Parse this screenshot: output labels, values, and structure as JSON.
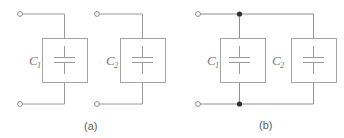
{
  "figure": {
    "type": "circuit-diagram",
    "line_color": "#9a9a9a",
    "box_color": "#a0a0a0",
    "node_color": "#3a3a3a",
    "terminal_color": "#8a8a8a",
    "background": "#ffffff"
  },
  "panels": [
    {
      "id": "panel-a",
      "label": "(a)",
      "label_x": 91,
      "label_y": 130,
      "components": [
        {
          "id": "cap-a1",
          "label": "C",
          "subscript": "1",
          "label_x": 29,
          "label_y": 65,
          "sub_x": 37,
          "sub_y": 68,
          "box": {
            "x": 42,
            "y": 38,
            "w": 45,
            "h": 44
          }
        },
        {
          "id": "cap-a2",
          "label": "C",
          "subscript": "2",
          "label_x": 106,
          "label_y": 65,
          "sub_x": 114,
          "sub_y": 68,
          "box": {
            "x": 120,
            "y": 38,
            "w": 45,
            "h": 44
          }
        }
      ],
      "terminals": [
        {
          "id": "terminal-a1-top",
          "x": 20,
          "y": 14
        },
        {
          "id": "terminal-a1-bottom",
          "x": 20,
          "y": 104
        },
        {
          "id": "terminal-a2-top",
          "x": 97,
          "y": 14
        },
        {
          "id": "terminal-a2-bottom",
          "x": 97,
          "y": 104
        }
      ],
      "nodes": []
    },
    {
      "id": "panel-b",
      "label": "(b)",
      "label_x": 266,
      "label_y": 129,
      "components": [
        {
          "id": "cap-b1",
          "label": "C",
          "subscript": "1",
          "label_x": 207,
          "label_y": 65,
          "sub_x": 215,
          "sub_y": 68,
          "box": {
            "x": 220,
            "y": 38,
            "w": 45,
            "h": 44
          }
        },
        {
          "id": "cap-b2",
          "label": "C",
          "subscript": "2",
          "label_x": 272,
          "label_y": 65,
          "sub_x": 280,
          "sub_y": 68,
          "box": {
            "x": 291,
            "y": 38,
            "w": 45,
            "h": 44
          }
        }
      ],
      "terminals": [
        {
          "id": "terminal-b-top",
          "x": 198,
          "y": 14
        },
        {
          "id": "terminal-b-bottom",
          "x": 198,
          "y": 104
        }
      ],
      "nodes": [
        {
          "id": "junction-b-top",
          "x": 239,
          "y": 14
        },
        {
          "id": "junction-b-bottom",
          "x": 239,
          "y": 104
        }
      ]
    }
  ]
}
